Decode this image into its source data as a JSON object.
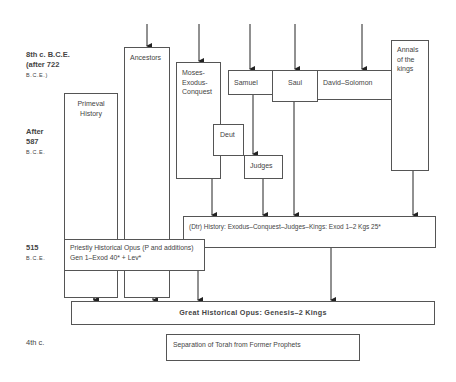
{
  "periods": [
    {
      "id": "8th",
      "line1": "8th c. B.C.E.",
      "line2": "(after 722",
      "line3": "B.C.E.)"
    },
    {
      "id": "587",
      "line1": "After",
      "line2": "587",
      "line3": "B.C.E."
    },
    {
      "id": "515",
      "line1": "515",
      "line2": "B.C.E."
    },
    {
      "id": "4th",
      "line1": "4th c."
    }
  ],
  "boxes": {
    "primeval": {
      "line1": "Primeval",
      "line2": "History"
    },
    "ancestors": {
      "line1": "Ancestors"
    },
    "moses": {
      "line1": "Moses-",
      "line2": "Exodus-",
      "line3": "Conquest"
    },
    "samuel": {
      "line1": "Samuel"
    },
    "saul": {
      "line1": "Saul"
    },
    "david": {
      "line1": "David–Solomon"
    },
    "annals": {
      "line1": "Annals",
      "line2": "of the",
      "line3": "kings"
    },
    "deut": {
      "line1": "Deut"
    },
    "judges": {
      "line1": "Judges"
    },
    "dtr": {
      "line1": "(Dtr) History: Exodus–Conquest–Judges–Kings: Exod 1–2 Kgs 25*"
    },
    "priestly": {
      "line1": "Priestly Historical Opus (P and additions)",
      "line2": "Gen 1–Exod 40* + Lev*"
    },
    "great": {
      "line1": "Great Historical Opus: Genesis–2 Kings"
    },
    "separation": {
      "line1": "Separation of Torah from Former Prophets"
    }
  }
}
